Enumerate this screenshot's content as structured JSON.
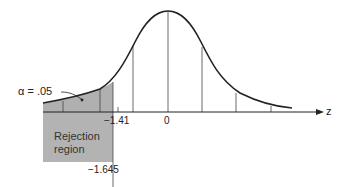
{
  "diagram": {
    "alpha_label": "α = .05",
    "rejection_label_line1": "Rejection",
    "rejection_label_line2": "region",
    "tick_neg141": "−1.41",
    "tick_zero": "0",
    "critical_value": "−1.645",
    "axis_label": "z",
    "colors": {
      "curve": "#222222",
      "shade": "#b0b0b0",
      "box": "#b3b3b3"
    }
  }
}
